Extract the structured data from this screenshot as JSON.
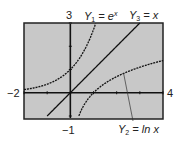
{
  "chart_data": {
    "type": "line",
    "title": "",
    "xlabel": "",
    "ylabel": "",
    "xlim": [
      -2,
      4
    ],
    "ylim": [
      -1,
      3
    ],
    "window_labels": {
      "xmin": "−2",
      "xmax": "4",
      "ymin": "−1",
      "ymax": "3"
    },
    "series": [
      {
        "name": "Y1 = e^x",
        "function": "e^x",
        "style": "dotted"
      },
      {
        "name": "Y2 = ln x",
        "function": "ln x",
        "style": "dotted"
      },
      {
        "name": "Y3 = x",
        "function": "x",
        "style": "solid"
      }
    ],
    "annotations": [
      {
        "text": "Y2 = ln x",
        "points_to": "ln x curve near x=2.3"
      }
    ],
    "background": "#c8c8c8"
  },
  "labels": {
    "ymax": "3",
    "xmin": "−2",
    "xmax": "4",
    "ymin": "−1",
    "y1_name": "Y",
    "y1_sub": "1",
    "y1_eq": " = e",
    "y1_sup": "x",
    "y3_name": "Y",
    "y3_sub": "3",
    "y3_eq": " = x",
    "y2_name": "Y",
    "y2_sub": "2",
    "y2_eq": " = ln x"
  }
}
